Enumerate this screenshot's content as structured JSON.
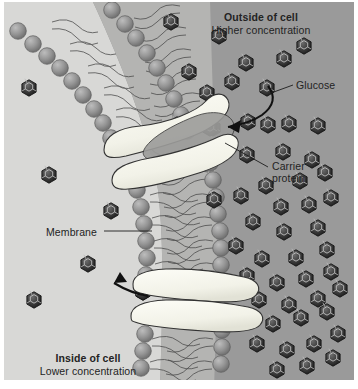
{
  "diagram": {
    "type": "cell-membrane-transport"
  },
  "labels": {
    "outside_title": "Outside of cell",
    "outside_sub": "Higher concentration",
    "inside_title": "Inside of cell",
    "inside_sub": "Lower concentration",
    "glucose": "Glucose",
    "carrier_line1": "Carrier",
    "carrier_line2": "protein",
    "membrane": "Membrane"
  },
  "colors": {
    "outside_bg": "#9a9a9a",
    "inside_bg": "#d8d8d6",
    "membrane_fill": "#b4b4b2",
    "phospholipid_head": "#8a8a8a",
    "phospholipid_head_light": "#a6a6a6",
    "carrier_protein": "#f6f6ef",
    "glucose_dark": "#2f2f2f",
    "glucose_light": "#8c8c8c",
    "text": "#232323",
    "page_bg": "#ffffff"
  },
  "glucose_outside": [
    [
      171,
      22
    ],
    [
      219,
      36
    ],
    [
      246,
      63
    ],
    [
      284,
      59
    ],
    [
      304,
      46
    ],
    [
      189,
      72
    ],
    [
      232,
      82
    ],
    [
      267,
      88
    ],
    [
      207,
      93
    ],
    [
      248,
      122
    ],
    [
      213,
      128
    ],
    [
      177,
      125
    ],
    [
      268,
      125
    ],
    [
      289,
      124
    ],
    [
      318,
      126
    ],
    [
      247,
      155
    ],
    [
      283,
      152
    ],
    [
      312,
      160
    ],
    [
      266,
      186
    ],
    [
      300,
      181
    ],
    [
      325,
      173
    ],
    [
      241,
      196
    ],
    [
      214,
      200
    ],
    [
      281,
      207
    ],
    [
      309,
      205
    ],
    [
      331,
      198
    ],
    [
      253,
      222
    ],
    [
      284,
      232
    ],
    [
      318,
      228
    ],
    [
      236,
      246
    ],
    [
      262,
      259
    ],
    [
      296,
      258
    ],
    [
      327,
      250
    ],
    [
      247,
      276
    ],
    [
      277,
      283
    ],
    [
      306,
      279
    ],
    [
      331,
      272
    ],
    [
      259,
      300
    ],
    [
      289,
      305
    ],
    [
      318,
      299
    ],
    [
      340,
      289
    ],
    [
      243,
      318
    ],
    [
      273,
      324
    ],
    [
      301,
      318
    ],
    [
      327,
      312
    ],
    [
      257,
      344
    ],
    [
      287,
      350
    ],
    [
      314,
      344
    ],
    [
      338,
      334
    ],
    [
      277,
      370
    ],
    [
      307,
      366
    ],
    [
      333,
      358
    ]
  ],
  "glucose_inside": [
    [
      29,
      88
    ],
    [
      49,
      175
    ],
    [
      111,
      211
    ],
    [
      88,
      264
    ],
    [
      34,
      300
    ],
    [
      143,
      292
    ]
  ],
  "glucose_in_channel": [
    [
      210,
      128
    ],
    [
      143,
      292
    ]
  ]
}
